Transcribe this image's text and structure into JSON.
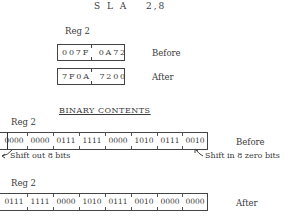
{
  "instruction": {
    "mnemonic": "S L A",
    "operands": "2,8"
  },
  "hex_section": {
    "reg_label": "Reg 2",
    "before": {
      "value": "007F  0A72",
      "label": "Before"
    },
    "after": {
      "value": "7F0A  7200",
      "label": "After"
    }
  },
  "binary_section": {
    "title": "BINARY CONTENTS",
    "before": {
      "reg_label": "Reg 2",
      "nibbles": [
        "0000",
        "0000",
        "0111",
        "1111",
        "0000",
        "1010",
        "0111",
        "0010"
      ],
      "label": "Before",
      "annotation_left": "Shift out 8 bits",
      "annotation_right": "Shift in 8 zero bits"
    },
    "after": {
      "reg_label": "Reg 2",
      "nibbles": [
        "0111",
        "1111",
        "0000",
        "1010",
        "0111",
        "0010",
        "0000",
        "0000"
      ],
      "label": "After"
    }
  }
}
